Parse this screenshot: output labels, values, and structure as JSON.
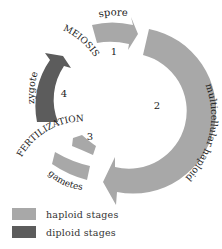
{
  "diagram": {
    "type": "life-cycle",
    "stages": [
      {
        "number": "1",
        "label": "spore",
        "ploidy": "haploid"
      },
      {
        "number": "2",
        "label": "multicellular haploid",
        "ploidy": "haploid"
      },
      {
        "number": "3",
        "label": "gametes",
        "ploidy": "haploid"
      },
      {
        "number": "4",
        "label": "zygote",
        "ploidy": "diploid"
      }
    ],
    "processes": {
      "meiosis": "MEIOSIS",
      "fertilization": "FERTILIZATION"
    }
  },
  "legend": {
    "items": [
      {
        "label": "haploid stages",
        "color": "#a8a8a8"
      },
      {
        "label": "diploid stages",
        "color": "#5c5c5c"
      }
    ]
  },
  "colors": {
    "haploid": "#a8a8a8",
    "diploid": "#5c5c5c",
    "text": "#222222"
  }
}
